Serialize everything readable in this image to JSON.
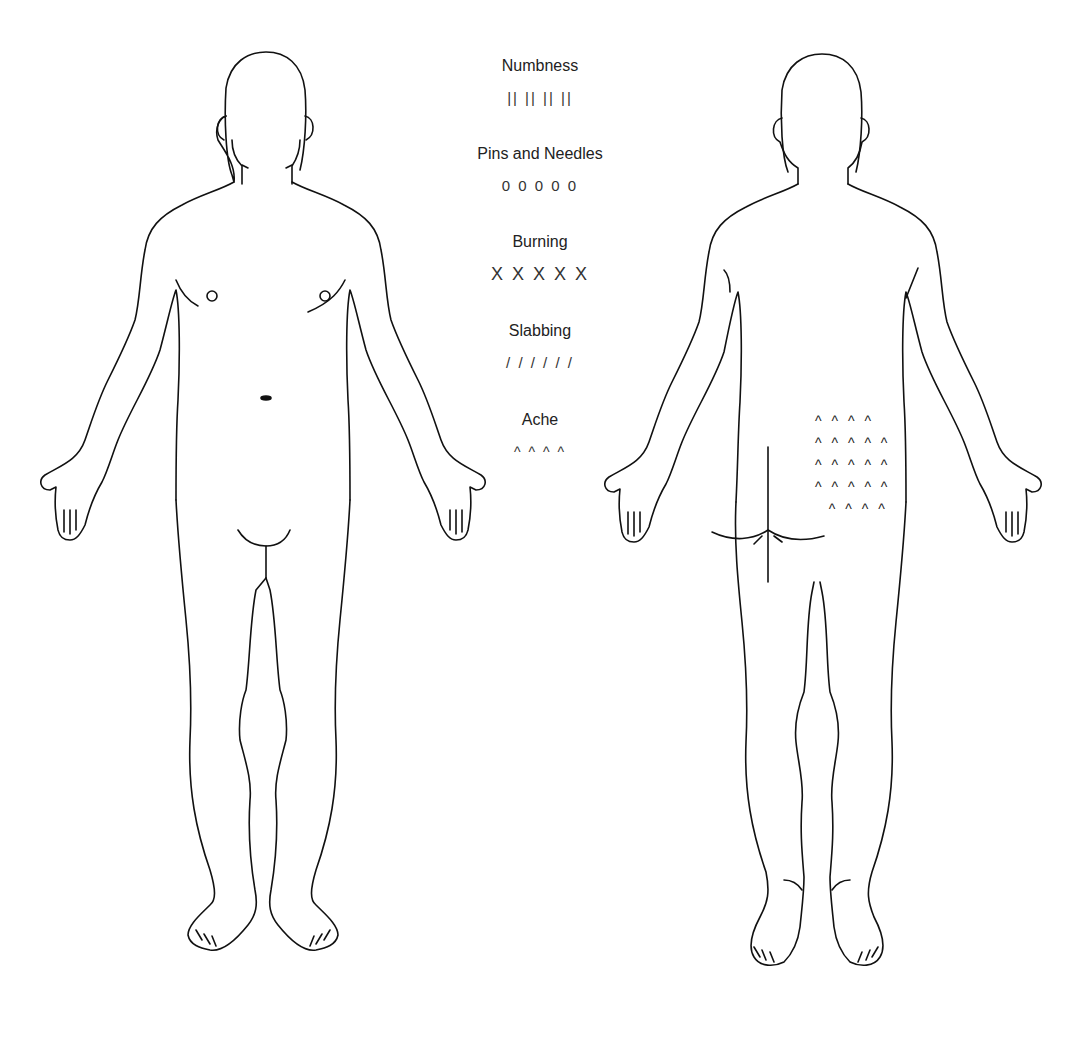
{
  "figures": {
    "front": {
      "label": "front-view body outline"
    },
    "back": {
      "label": "back-view body outline"
    }
  },
  "legend": {
    "items": [
      {
        "label": "Numbness",
        "symbol": "|| || || ||"
      },
      {
        "label": "Pins and Needles",
        "symbol": "0 0 0 0 0"
      },
      {
        "label": "Burning",
        "symbol": "X X X X X"
      },
      {
        "label": "Slabbing",
        "symbol": "/ / / / / /"
      },
      {
        "label": "Ache",
        "symbol": "^ ^ ^ ^"
      }
    ]
  },
  "markings": {
    "back_lower_right": {
      "type": "Ache",
      "rows": [
        "^ ^ ^ ^",
        "^ ^ ^ ^ ^",
        "^ ^ ^ ^ ^",
        "^ ^ ^ ^ ^",
        "  ^ ^ ^ ^"
      ]
    }
  },
  "colors": {
    "line": "#111111",
    "background": "#ffffff"
  }
}
